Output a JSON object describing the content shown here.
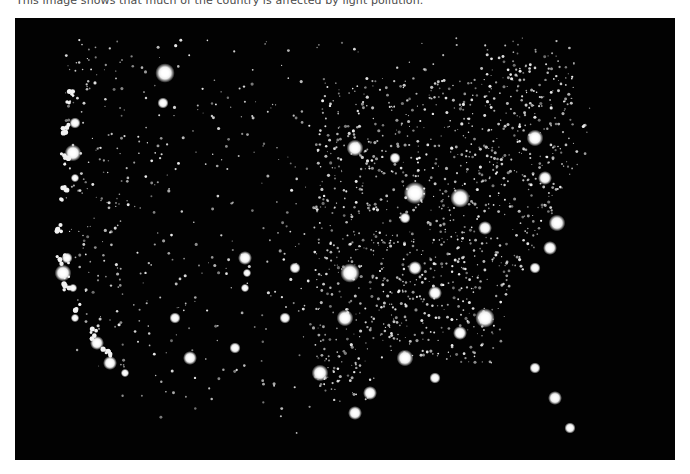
{
  "caption": "This image shows that much of the country is affected by light pollution.",
  "photo": {
    "subject": "satellite-night-lights-united-states",
    "background_color": "#020202",
    "light_color": "#f4f4f4"
  }
}
